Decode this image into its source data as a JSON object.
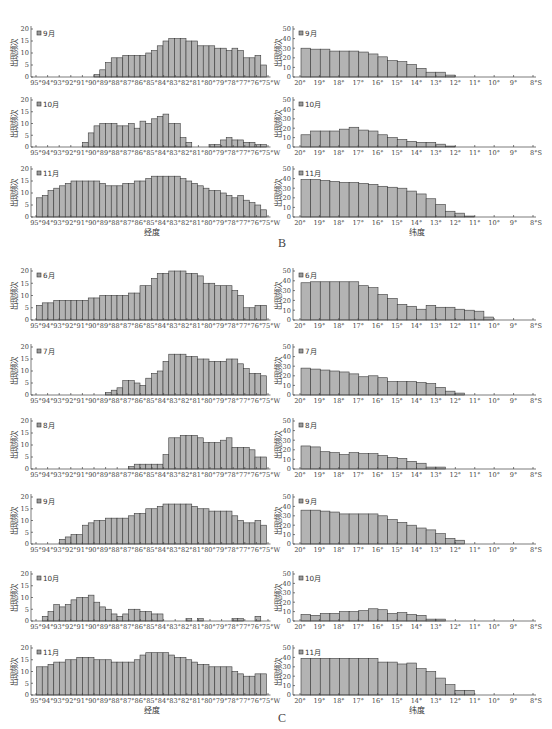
{
  "figure": {
    "panels": [
      {
        "label": "B"
      },
      {
        "label": "C"
      }
    ],
    "bar_fill": "#b3b3b3",
    "bar_stroke": "#3a3a3a"
  },
  "chart_data": [
    {
      "panel": "B",
      "month": "9月",
      "type": "bar",
      "axis": "longitude",
      "xlabel": "",
      "ylabel": "出现频次",
      "ylim": [
        0,
        20
      ],
      "yticks": [
        0,
        5,
        10,
        15,
        20
      ],
      "x_start": 95,
      "x_end": 75,
      "bin_width": 0.5,
      "xticklabels": [
        "95°",
        "94°",
        "93°",
        "92°",
        "91°",
        "90°",
        "89°",
        "88°",
        "87°",
        "86°",
        "85°",
        "84°",
        "83°",
        "82°",
        "81°",
        "80°",
        "79°",
        "78°",
        "77°",
        "76°",
        "75°W"
      ],
      "values": [
        0,
        0,
        0,
        0,
        0,
        0,
        0,
        0,
        0,
        0,
        1,
        3,
        6,
        8,
        8,
        9,
        9,
        9,
        9,
        10,
        11,
        13,
        15,
        16,
        16,
        16,
        15,
        15,
        13,
        13,
        13,
        12,
        12,
        11,
        12,
        11,
        8,
        8,
        9,
        5
      ]
    },
    {
      "panel": "B",
      "month": "9月",
      "type": "bar",
      "axis": "latitude",
      "xlabel": "",
      "ylabel": "出现频次",
      "ylim": [
        0,
        50
      ],
      "yticks": [
        0,
        10,
        20,
        30,
        40,
        50
      ],
      "x_start": 20,
      "x_end": 8,
      "bin_width": 0.5,
      "xticklabels": [
        "20°",
        "19°",
        "18°",
        "17°",
        "16°",
        "15°",
        "14°",
        "13°",
        "12°",
        "11°",
        "10°",
        "9°",
        "8°S"
      ],
      "values": [
        30,
        29,
        29,
        27,
        27,
        27,
        26,
        24,
        21,
        17,
        16,
        13,
        9,
        5,
        5,
        2,
        0,
        0,
        0,
        0,
        0,
        0,
        0,
        0
      ]
    },
    {
      "panel": "B",
      "month": "10月",
      "type": "bar",
      "axis": "longitude",
      "xlabel": "",
      "ylabel": "出现频次",
      "ylim": [
        0,
        20
      ],
      "yticks": [
        0,
        5,
        10,
        15,
        20
      ],
      "x_start": 95,
      "x_end": 75,
      "bin_width": 0.5,
      "xticklabels": [
        "95°",
        "94°",
        "93°",
        "92°",
        "91°",
        "90°",
        "89°",
        "88°",
        "87°",
        "86°",
        "85°",
        "84°",
        "83°",
        "82°",
        "81°",
        "80°",
        "79°",
        "78°",
        "77°",
        "76°",
        "75°W"
      ],
      "values": [
        0,
        0,
        0,
        0,
        0,
        0,
        0,
        0,
        2,
        6,
        9,
        10,
        10,
        10,
        9,
        9,
        10,
        8,
        11,
        10,
        12,
        13,
        14,
        10,
        10,
        4,
        2,
        0,
        0,
        0,
        1,
        1,
        3,
        4,
        3,
        3,
        2,
        2,
        1,
        1
      ]
    },
    {
      "panel": "B",
      "month": "10月",
      "type": "bar",
      "axis": "latitude",
      "xlabel": "",
      "ylabel": "出现频次",
      "ylim": [
        0,
        50
      ],
      "yticks": [
        0,
        10,
        20,
        30,
        40,
        50
      ],
      "x_start": 20,
      "x_end": 8,
      "bin_width": 0.5,
      "xticklabels": [
        "20°",
        "19°",
        "18°",
        "17°",
        "16°",
        "15°",
        "14°",
        "13°",
        "12°",
        "11°",
        "10°",
        "9°",
        "8°S"
      ],
      "values": [
        13,
        17,
        17,
        17,
        19,
        21,
        18,
        17,
        13,
        10,
        8,
        6,
        5,
        5,
        3,
        1,
        0,
        0,
        0,
        0,
        0,
        0,
        0,
        0
      ]
    },
    {
      "panel": "B",
      "month": "11月",
      "type": "bar",
      "axis": "longitude",
      "xlabel": "经度",
      "ylabel": "出现频次",
      "ylim": [
        0,
        20
      ],
      "yticks": [
        0,
        5,
        10,
        15,
        20
      ],
      "x_start": 95,
      "x_end": 75,
      "bin_width": 0.5,
      "xticklabels": [
        "95°",
        "94°",
        "93°",
        "92°",
        "91°",
        "90°",
        "89°",
        "88°",
        "87°",
        "86°",
        "85°",
        "84°",
        "83°",
        "82°",
        "81°",
        "80°",
        "79°",
        "78°",
        "77°",
        "76°",
        "75°W"
      ],
      "values": [
        8,
        9,
        11,
        12,
        13,
        14,
        15,
        15,
        15,
        15,
        15,
        14,
        13,
        13,
        13,
        14,
        14,
        15,
        15,
        16,
        17,
        17,
        17,
        17,
        17,
        16,
        15,
        14,
        13,
        12,
        11,
        11,
        10,
        9,
        8,
        9,
        7,
        6,
        5,
        3
      ]
    },
    {
      "panel": "B",
      "month": "11月",
      "type": "bar",
      "axis": "latitude",
      "xlabel": "纬度",
      "ylabel": "出现频次",
      "ylim": [
        0,
        50
      ],
      "yticks": [
        0,
        10,
        20,
        30,
        40,
        50
      ],
      "x_start": 20,
      "x_end": 8,
      "bin_width": 0.5,
      "xticklabels": [
        "20°",
        "19°",
        "18°",
        "17°",
        "16°",
        "15°",
        "14°",
        "13°",
        "12°",
        "11°",
        "10°",
        "9°",
        "8°S"
      ],
      "values": [
        39,
        39,
        38,
        37,
        36,
        36,
        35,
        34,
        32,
        31,
        30,
        27,
        24,
        19,
        13,
        6,
        4,
        1,
        0,
        0,
        0,
        0,
        0,
        0
      ]
    },
    {
      "panel": "C",
      "month": "6月",
      "type": "bar",
      "axis": "longitude",
      "xlabel": "",
      "ylabel": "出现频次",
      "ylim": [
        0,
        20
      ],
      "yticks": [
        0,
        5,
        10,
        15,
        20
      ],
      "x_start": 95,
      "x_end": 75,
      "bin_width": 0.5,
      "xticklabels": [
        "95°",
        "94°",
        "93°",
        "92°",
        "91°",
        "90°",
        "89°",
        "88°",
        "87°",
        "86°",
        "85°",
        "84°",
        "83°",
        "82°",
        "81°",
        "80°",
        "79°",
        "78°",
        "77°",
        "76°",
        "75°W"
      ],
      "values": [
        6,
        7,
        7,
        8,
        8,
        8,
        8,
        8,
        8,
        9,
        9,
        10,
        10,
        10,
        10,
        10,
        11,
        11,
        14,
        14,
        17,
        19,
        19,
        20,
        20,
        20,
        19,
        19,
        18,
        15,
        15,
        14,
        14,
        14,
        12,
        10,
        5,
        5,
        6,
        6
      ]
    },
    {
      "panel": "C",
      "month": "6月",
      "type": "bar",
      "axis": "latitude",
      "xlabel": "",
      "ylabel": "出现频次",
      "ylim": [
        0,
        50
      ],
      "yticks": [
        0,
        10,
        20,
        30,
        40,
        50
      ],
      "x_start": 20,
      "x_end": 8,
      "bin_width": 0.5,
      "xticklabels": [
        "20°",
        "19°",
        "18°",
        "17°",
        "16°",
        "15°",
        "14°",
        "13°",
        "12°",
        "11°",
        "10°",
        "9°",
        "8°S"
      ],
      "values": [
        38,
        39,
        39,
        39,
        39,
        39,
        35,
        33,
        26,
        22,
        16,
        14,
        11,
        15,
        13,
        13,
        11,
        10,
        9,
        3,
        0,
        0,
        0,
        0
      ]
    },
    {
      "panel": "C",
      "month": "7月",
      "type": "bar",
      "axis": "longitude",
      "xlabel": "",
      "ylabel": "出现频次",
      "ylim": [
        0,
        20
      ],
      "yticks": [
        0,
        5,
        10,
        15,
        20
      ],
      "x_start": 95,
      "x_end": 75,
      "bin_width": 0.5,
      "xticklabels": [
        "95°",
        "94°",
        "93°",
        "92°",
        "91°",
        "90°",
        "89°",
        "88°",
        "87°",
        "86°",
        "85°",
        "84°",
        "83°",
        "82°",
        "81°",
        "80°",
        "79°",
        "78°",
        "77°",
        "76°",
        "75°W"
      ],
      "values": [
        0,
        0,
        0,
        0,
        0,
        0,
        0,
        0,
        0,
        0,
        0,
        0,
        1,
        2,
        3,
        6,
        6,
        5,
        4,
        7,
        9,
        10,
        14,
        17,
        17,
        17,
        16,
        16,
        15,
        15,
        14,
        14,
        14,
        15,
        15,
        13,
        11,
        9,
        9,
        8
      ]
    },
    {
      "panel": "C",
      "month": "7月",
      "type": "bar",
      "axis": "latitude",
      "xlabel": "",
      "ylabel": "出现频次",
      "ylim": [
        0,
        50
      ],
      "yticks": [
        0,
        10,
        20,
        30,
        40,
        50
      ],
      "x_start": 20,
      "x_end": 8,
      "bin_width": 0.5,
      "xticklabels": [
        "20°",
        "19°",
        "18°",
        "17°",
        "16°",
        "15°",
        "14°",
        "13°",
        "12°",
        "11°",
        "10°",
        "9°",
        "8°S"
      ],
      "values": [
        28,
        27,
        26,
        25,
        24,
        22,
        19,
        20,
        18,
        14,
        14,
        14,
        13,
        12,
        8,
        4,
        2,
        0,
        0,
        0,
        0,
        0,
        0,
        0
      ]
    },
    {
      "panel": "C",
      "month": "8月",
      "type": "bar",
      "axis": "longitude",
      "xlabel": "",
      "ylabel": "出现频次",
      "ylim": [
        0,
        20
      ],
      "yticks": [
        0,
        5,
        10,
        15,
        20
      ],
      "x_start": 95,
      "x_end": 75,
      "bin_width": 0.5,
      "xticklabels": [
        "95°",
        "94°",
        "93°",
        "92°",
        "91°",
        "90°",
        "89°",
        "88°",
        "87°",
        "86°",
        "85°",
        "84°",
        "83°",
        "82°",
        "81°",
        "80°",
        "79°",
        "78°",
        "77°",
        "76°",
        "75°W"
      ],
      "values": [
        0,
        0,
        0,
        0,
        0,
        0,
        0,
        0,
        0,
        0,
        0,
        0,
        0,
        0,
        0,
        0,
        1,
        2,
        2,
        2,
        2,
        2,
        6,
        13,
        13,
        14,
        14,
        14,
        13,
        11,
        11,
        11,
        12,
        13,
        9,
        9,
        9,
        8,
        5,
        5
      ]
    },
    {
      "panel": "C",
      "month": "8月",
      "type": "bar",
      "axis": "latitude",
      "xlabel": "",
      "ylabel": "出现频次",
      "ylim": [
        0,
        50
      ],
      "yticks": [
        0,
        10,
        20,
        30,
        40,
        50
      ],
      "x_start": 20,
      "x_end": 8,
      "bin_width": 0.5,
      "xticklabels": [
        "20°",
        "19°",
        "18°",
        "17°",
        "16°",
        "15°",
        "14°",
        "13°",
        "12°",
        "11°",
        "10°",
        "9°",
        "8°S"
      ],
      "values": [
        24,
        23,
        18,
        17,
        15,
        17,
        16,
        16,
        14,
        12,
        11,
        8,
        6,
        2,
        2,
        0,
        0,
        0,
        0,
        0,
        0,
        0,
        0,
        0
      ]
    },
    {
      "panel": "C",
      "month": "9月",
      "type": "bar",
      "axis": "longitude",
      "xlabel": "",
      "ylabel": "出现频次",
      "ylim": [
        0,
        20
      ],
      "yticks": [
        0,
        5,
        10,
        15,
        20
      ],
      "x_start": 95,
      "x_end": 75,
      "bin_width": 0.5,
      "xticklabels": [
        "95°",
        "94°",
        "93°",
        "92°",
        "91°",
        "90°",
        "89°",
        "88°",
        "87°",
        "86°",
        "85°",
        "84°",
        "83°",
        "82°",
        "81°",
        "80°",
        "79°",
        "78°",
        "77°",
        "76°",
        "75°W"
      ],
      "values": [
        0,
        0,
        0,
        0,
        2,
        3,
        4,
        4,
        8,
        9,
        10,
        10,
        11,
        11,
        11,
        11,
        12,
        13,
        13,
        15,
        15,
        16,
        17,
        17,
        17,
        17,
        17,
        16,
        15,
        15,
        14,
        14,
        14,
        14,
        12,
        10,
        9,
        9,
        10,
        8
      ]
    },
    {
      "panel": "C",
      "month": "9月",
      "type": "bar",
      "axis": "latitude",
      "xlabel": "",
      "ylabel": "出现频次",
      "ylim": [
        0,
        50
      ],
      "yticks": [
        0,
        10,
        20,
        30,
        40,
        50
      ],
      "x_start": 20,
      "x_end": 8,
      "bin_width": 0.5,
      "xticklabels": [
        "20°",
        "19°",
        "18°",
        "17°",
        "16°",
        "15°",
        "14°",
        "13°",
        "12°",
        "11°",
        "10°",
        "9°",
        "8°S"
      ],
      "values": [
        36,
        36,
        35,
        34,
        32,
        32,
        32,
        32,
        30,
        26,
        23,
        20,
        17,
        15,
        11,
        6,
        4,
        0,
        0,
        0,
        0,
        0,
        0,
        0
      ]
    },
    {
      "panel": "C",
      "month": "10月",
      "type": "bar",
      "axis": "longitude",
      "xlabel": "",
      "ylabel": "出现频次",
      "ylim": [
        0,
        20
      ],
      "yticks": [
        0,
        5,
        10,
        15,
        20
      ],
      "x_start": 95,
      "x_end": 75,
      "bin_width": 0.5,
      "xticklabels": [
        "95°",
        "94°",
        "93°",
        "92°",
        "91°",
        "90°",
        "89°",
        "88°",
        "87°",
        "86°",
        "85°",
        "84°",
        "83°",
        "82°",
        "81°",
        "80°",
        "79°",
        "78°",
        "77°",
        "76°",
        "75°W"
      ],
      "values": [
        0,
        2,
        4,
        7,
        6,
        7,
        9,
        10,
        10,
        11,
        8,
        6,
        5,
        3,
        2,
        3,
        5,
        5,
        4,
        4,
        3,
        3,
        0,
        0,
        0,
        0,
        1,
        0,
        1,
        0,
        0,
        0,
        0,
        0,
        1,
        1,
        0,
        0,
        2,
        0
      ]
    },
    {
      "panel": "C",
      "month": "10月",
      "type": "bar",
      "axis": "latitude",
      "xlabel": "",
      "ylabel": "出现频次",
      "ylim": [
        0,
        50
      ],
      "yticks": [
        0,
        10,
        20,
        30,
        40,
        50
      ],
      "x_start": 20,
      "x_end": 8,
      "bin_width": 0.5,
      "xticklabels": [
        "20°",
        "19°",
        "18°",
        "17°",
        "16°",
        "15°",
        "14°",
        "13°",
        "12°",
        "11°",
        "10°",
        "9°",
        "8°S"
      ],
      "values": [
        7,
        6,
        8,
        8,
        10,
        10,
        11,
        13,
        12,
        8,
        9,
        7,
        6,
        2,
        2,
        0,
        0,
        0,
        0,
        0,
        0,
        0,
        0,
        0
      ]
    },
    {
      "panel": "C",
      "month": "11月",
      "type": "bar",
      "axis": "longitude",
      "xlabel": "经度",
      "ylabel": "出现频次",
      "ylim": [
        0,
        20
      ],
      "yticks": [
        0,
        5,
        10,
        15,
        20
      ],
      "x_start": 95,
      "x_end": 75,
      "bin_width": 0.5,
      "xticklabels": [
        "95°",
        "94°",
        "93°",
        "92°",
        "91°",
        "90°",
        "89°",
        "88°",
        "87°",
        "86°",
        "85°",
        "84°",
        "83°",
        "82°",
        "81°",
        "80°",
        "79°",
        "78°",
        "77°",
        "76°",
        "75°W"
      ],
      "values": [
        12,
        12,
        13,
        14,
        14,
        15,
        15,
        16,
        16,
        16,
        15,
        15,
        15,
        14,
        14,
        14,
        14,
        15,
        17,
        18,
        18,
        18,
        18,
        17,
        16,
        16,
        15,
        14,
        13,
        13,
        12,
        12,
        12,
        12,
        10,
        9,
        8,
        8,
        9,
        9
      ]
    },
    {
      "panel": "C",
      "month": "11月",
      "type": "bar",
      "axis": "latitude",
      "xlabel": "纬度",
      "ylabel": "出现频次",
      "ylim": [
        0,
        50
      ],
      "yticks": [
        0,
        10,
        20,
        30,
        40,
        50
      ],
      "x_start": 20,
      "x_end": 8,
      "bin_width": 0.5,
      "xticklabels": [
        "20°",
        "19°",
        "18°",
        "17°",
        "16°",
        "15°",
        "14°",
        "13°",
        "12°",
        "11°",
        "10°",
        "9°",
        "8°S"
      ],
      "values": [
        39,
        39,
        39,
        39,
        39,
        39,
        39,
        39,
        35,
        35,
        33,
        34,
        28,
        25,
        18,
        11,
        5,
        5,
        0,
        0,
        0,
        0,
        0,
        0
      ]
    }
  ]
}
